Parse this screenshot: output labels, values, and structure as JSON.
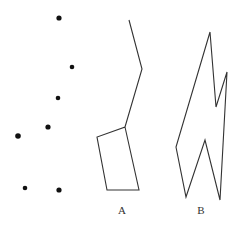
{
  "figure": {
    "width": 239,
    "height": 226,
    "stroke_color": "#333333",
    "dot_color": "#111111",
    "dots": [
      {
        "x": 59,
        "y": 18,
        "r": 2.6
      },
      {
        "x": 72,
        "y": 67,
        "r": 2.3
      },
      {
        "x": 58,
        "y": 98,
        "r": 2.3
      },
      {
        "x": 48,
        "y": 127,
        "r": 2.6
      },
      {
        "x": 18,
        "y": 136,
        "r": 2.8
      },
      {
        "x": 25,
        "y": 188,
        "r": 2.3
      },
      {
        "x": 59,
        "y": 190,
        "r": 2.6
      }
    ],
    "shape_a": {
      "label": "A",
      "label_pos": {
        "x": 122,
        "y": 214
      },
      "points": "129,20 142,69 125,127 97,137 107,190 139,190 125,127"
    },
    "shape_b": {
      "label": "B",
      "label_pos": {
        "x": 201,
        "y": 214
      },
      "points": "210,32 216,107 227,72 220,200 205,140 186,197 176,147 210,32"
    }
  }
}
